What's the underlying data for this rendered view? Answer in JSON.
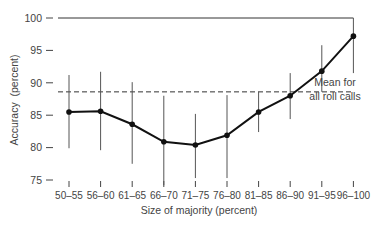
{
  "chart_data": {
    "type": "line",
    "title": "",
    "xlabel": "Size of majority (percent)",
    "ylabel": "Accuracy  (percent)",
    "ylim": [
      75,
      100
    ],
    "yticks": [
      75,
      80,
      85,
      90,
      95,
      100
    ],
    "ytick_labels": [
      "75",
      "80",
      "85",
      "90",
      "95",
      "100"
    ],
    "grid": false,
    "categories": [
      "50–55",
      "56–60",
      "61–65",
      "66–70",
      "71–75",
      "76–80",
      "81–85",
      "86–90",
      "91–95",
      "96–100"
    ],
    "series": [
      {
        "name": "Accuracy",
        "values": [
          85.5,
          85.6,
          83.6,
          80.9,
          80.4,
          81.9,
          85.5,
          88.0,
          91.8,
          97.2
        ],
        "error_high": [
          91.2,
          91.7,
          90.1,
          88.0,
          85.2,
          88.1,
          88.6,
          91.5,
          95.8,
          100
        ],
        "error_low": [
          79.9,
          79.6,
          77.5,
          74.2,
          75.3,
          75.3,
          82.4,
          84.4,
          88.6,
          91.5
        ]
      }
    ],
    "reference_line": {
      "value": 88.6,
      "style": "dashed",
      "label_line1": "Mean for",
      "label_line2": "all roll calls"
    },
    "top_border_line": 100
  }
}
